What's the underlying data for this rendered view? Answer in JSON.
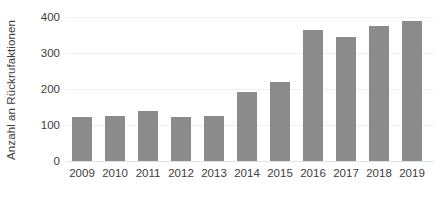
{
  "chart_data": {
    "type": "bar",
    "title": "",
    "subtitle": "",
    "xlabel": "",
    "ylabel": "Anzahl an Rückrufaktionen",
    "categories": [
      "2009",
      "2010",
      "2011",
      "2012",
      "2013",
      "2014",
      "2015",
      "2016",
      "2017",
      "2018",
      "2019"
    ],
    "values": [
      122,
      125,
      139,
      122,
      125,
      192,
      220,
      364,
      344,
      375,
      389
    ],
    "series": [
      {
        "name": "Anzahl an Rückrufaktionen",
        "values": [
          122,
          125,
          139,
          122,
          125,
          192,
          220,
          364,
          344,
          375,
          389
        ]
      }
    ],
    "ylim": [
      0,
      400
    ],
    "yticks": [
      0,
      100,
      200,
      300,
      400
    ],
    "ytick_labels": [
      "0",
      "100",
      "200",
      "300",
      "400"
    ],
    "xtick_labels": [
      "2009",
      "2010",
      "2011",
      "2012",
      "2013",
      "2014",
      "2015",
      "2016",
      "2017",
      "2018",
      "2019"
    ],
    "grid": true,
    "grid_axis": "y",
    "legend": false,
    "legend_position": "none",
    "bar_color": "#8b8b8b",
    "background_color": "#ffffff",
    "axis_text_color": "#3d3d3d",
    "gridline_color": "#f0f0f0",
    "annotations": []
  }
}
